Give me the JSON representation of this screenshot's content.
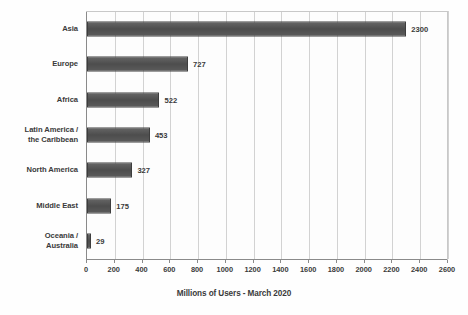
{
  "chart_data": {
    "type": "bar",
    "orientation": "horizontal",
    "title": "",
    "xlabel": "Millions of Users - March 2020",
    "ylabel": "",
    "categories": [
      "Asia",
      "Europe",
      "Africa",
      "Latin America /\nthe Caribbean",
      "North America",
      "Middle East",
      "Oceania /\nAustralia"
    ],
    "values": [
      2300,
      727,
      522,
      453,
      327,
      175,
      29
    ],
    "value_labels": [
      "2300",
      "727",
      "522",
      "453",
      "327",
      "175",
      "29"
    ],
    "xlim": [
      0,
      2600
    ],
    "xticks": [
      0,
      200,
      400,
      600,
      800,
      1000,
      1200,
      1400,
      1600,
      1800,
      2000,
      2200,
      2400,
      2600
    ],
    "xtick_labels": [
      "0",
      "200",
      "400",
      "600",
      "800",
      "1000",
      "1200",
      "1400",
      "1600",
      "1800",
      "2000",
      "2200",
      "2400",
      "2600"
    ],
    "grid": true,
    "grid_axis": "x",
    "legend": false,
    "bar_color": "#4e4e4e",
    "grid_color": "#d2d2d2",
    "axis_color": "#8a8a8a",
    "text_color": "#3a3a3a",
    "background_color": "#fefefe"
  }
}
